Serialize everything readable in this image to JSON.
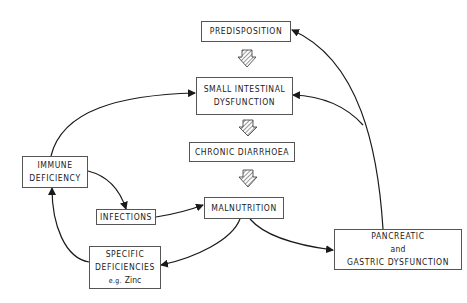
{
  "diagram": {
    "nodes": {
      "predisposition": {
        "lines": [
          "PREDISPOSITION"
        ]
      },
      "small_intestinal": {
        "lines": [
          "SMALL INTESTINAL",
          "DYSFUNCTION"
        ]
      },
      "chronic_diarrhoea": {
        "lines": [
          "CHRONIC DIARRHOEA"
        ]
      },
      "malnutrition": {
        "lines": [
          "MALNUTRITION"
        ]
      },
      "immune_deficiency": {
        "lines": [
          "IMMUNE",
          "DEFICIENCY"
        ]
      },
      "infections": {
        "lines": [
          "INFECTIONS"
        ]
      },
      "specific_deficiencies": {
        "lines": [
          "SPECIFIC",
          "DEFICIENCIES"
        ],
        "example": "e.g.",
        "example_value": "Zinc"
      },
      "pancreatic": {
        "lines": [
          "PANCREATIC",
          "and",
          "GASTRIC DYSFUNCTION"
        ]
      }
    },
    "edges": [
      {
        "from": "PREDISPOSITION",
        "to": "SMALL INTESTINAL DYSFUNCTION",
        "style": "hatched-arrow"
      },
      {
        "from": "SMALL INTESTINAL DYSFUNCTION",
        "to": "CHRONIC DIARRHOEA",
        "style": "hatched-arrow"
      },
      {
        "from": "CHRONIC DIARRHOEA",
        "to": "MALNUTRITION",
        "style": "hatched-arrow"
      },
      {
        "from": "IMMUNE DEFICIENCY",
        "to": "SMALL INTESTINAL DYSFUNCTION",
        "style": "curved-arrow"
      },
      {
        "from": "IMMUNE DEFICIENCY",
        "to": "INFECTIONS",
        "style": "curved-arrow"
      },
      {
        "from": "INFECTIONS",
        "to": "MALNUTRITION",
        "style": "curved-arrow"
      },
      {
        "from": "MALNUTRITION",
        "to": "SPECIFIC DEFICIENCIES",
        "style": "curved-arrow"
      },
      {
        "from": "MALNUTRITION",
        "to": "PANCREATIC and GASTRIC DYSFUNCTION",
        "style": "curved-arrow"
      },
      {
        "from": "SPECIFIC DEFICIENCIES",
        "to": "IMMUNE DEFICIENCY",
        "style": "curved-arrow"
      },
      {
        "from": "PANCREATIC and GASTRIC DYSFUNCTION",
        "to": "PREDISPOSITION",
        "style": "curved-arrow"
      },
      {
        "from": "PANCREATIC and GASTRIC DYSFUNCTION",
        "to": "SMALL INTESTINAL DYSFUNCTION",
        "style": "curved-arrow"
      }
    ],
    "colors": {
      "line": "#1a1a1a",
      "box_border": "#555555",
      "background": "#ffffff"
    }
  }
}
